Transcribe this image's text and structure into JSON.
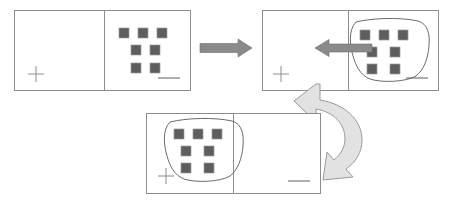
{
  "diagram": {
    "type": "instructional-sequence",
    "background_color": "#ffffff",
    "frame_color": "#8c8c8c",
    "square_fill_color": "#5e5e5e",
    "lasso_color": "#6b6b6b",
    "arrow_color": "#8a8a8a",
    "curved_arrow_fill": "#e2e2e2",
    "steps": [
      {
        "id": "step-1",
        "label": "Shapes grouped in right pane",
        "panel": {
          "x": 14,
          "y": 10,
          "width": 176,
          "height": 80,
          "divider_x": 104
        },
        "crosshair": {
          "cx": 36,
          "cy": 74,
          "arm": 8
        },
        "dash": {
          "x1": 158,
          "y1": 78,
          "x2": 180,
          "y2": 78
        },
        "lasso_present": false,
        "arrow_present": false,
        "squares": [
          {
            "x": 119,
            "y": 28,
            "size": 10
          },
          {
            "x": 138,
            "y": 28,
            "size": 10
          },
          {
            "x": 157,
            "y": 28,
            "size": 10
          },
          {
            "x": 131,
            "y": 45,
            "size": 10
          },
          {
            "x": 150,
            "y": 45,
            "size": 10
          },
          {
            "x": 131,
            "y": 63,
            "size": 10
          },
          {
            "x": 150,
            "y": 63,
            "size": 10
          }
        ]
      },
      {
        "id": "step-2",
        "label": "Shapes lassoed and dragged left",
        "panel": {
          "x": 262,
          "y": 10,
          "width": 176,
          "height": 80,
          "divider_x": 348
        },
        "crosshair": {
          "cx": 281,
          "cy": 74,
          "arm": 8
        },
        "dash": {
          "x1": 406,
          "y1": 78,
          "x2": 428,
          "y2": 78
        },
        "lasso_present": true,
        "arrow_present": true,
        "squares": [
          {
            "x": 360,
            "y": 30,
            "size": 10
          },
          {
            "x": 379,
            "y": 30,
            "size": 10
          },
          {
            "x": 398,
            "y": 30,
            "size": 10
          },
          {
            "x": 367,
            "y": 47,
            "size": 10
          },
          {
            "x": 390,
            "y": 47,
            "size": 10
          },
          {
            "x": 367,
            "y": 64,
            "size": 10
          },
          {
            "x": 390,
            "y": 64,
            "size": 10
          }
        ]
      },
      {
        "id": "step-3",
        "label": "Shapes placed in left pane",
        "panel": {
          "x": 146,
          "y": 113,
          "width": 174,
          "height": 80,
          "divider_x": 233
        },
        "crosshair": {
          "cx": 166,
          "cy": 176,
          "arm": 8
        },
        "dash": {
          "x1": 288,
          "y1": 181,
          "x2": 310,
          "y2": 181
        },
        "lasso_present": true,
        "arrow_present": false,
        "squares": [
          {
            "x": 174,
            "y": 129,
            "size": 10
          },
          {
            "x": 193,
            "y": 129,
            "size": 10
          },
          {
            "x": 212,
            "y": 129,
            "size": 10
          },
          {
            "x": 181,
            "y": 146,
            "size": 10
          },
          {
            "x": 204,
            "y": 146,
            "size": 10
          },
          {
            "x": 181,
            "y": 163,
            "size": 10
          },
          {
            "x": 204,
            "y": 163,
            "size": 10
          }
        ]
      }
    ],
    "connectors": [
      {
        "id": "connector-step1-to-step2",
        "name": "right-arrow-icon",
        "direction": "right",
        "style": "straight",
        "from_step": "step-1",
        "to_step": "step-2",
        "x1": 200,
        "y1": 48,
        "x2": 252,
        "y2": 48
      },
      {
        "id": "connector-drag-left",
        "name": "left-arrow-icon",
        "direction": "left",
        "style": "straight",
        "in_step": "step-2",
        "x1": 370,
        "y1": 48,
        "x2": 315,
        "y2": 48
      },
      {
        "id": "connector-step2-to-step3",
        "name": "curved-arrow-icon",
        "direction": "down-left",
        "style": "curved",
        "from_step": "step-2",
        "to_step": "step-3"
      }
    ]
  }
}
